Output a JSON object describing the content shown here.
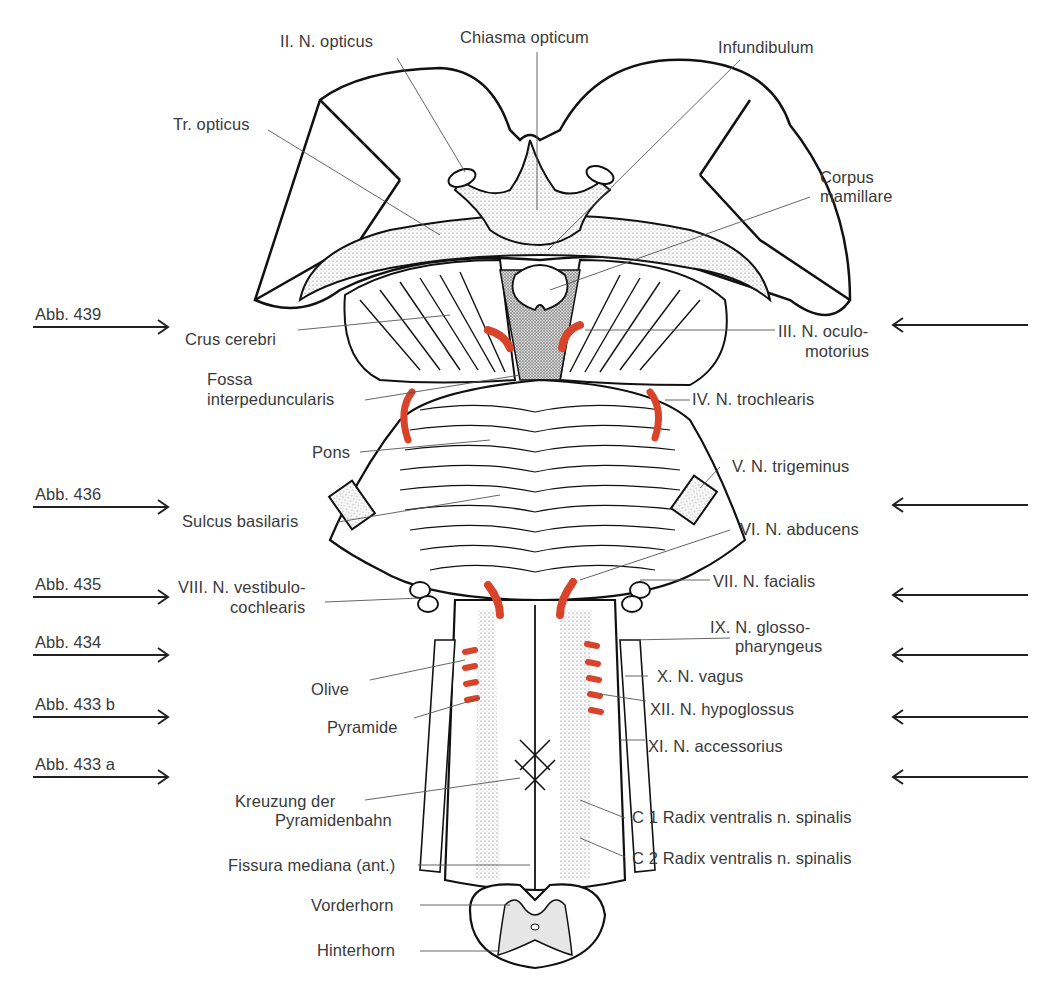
{
  "figure": {
    "type": "anatomical illustration",
    "nerve_color": "#d8432a",
    "outline_color": "#1a1a1a",
    "gray_matter_color": "#e6e6e6"
  },
  "labels_top": {
    "n_opticus": "II. N. opticus",
    "chiasma": "Chiasma opticum",
    "infundibulum": "Infundibulum",
    "tr_opticus": "Tr. opticus",
    "corpus_line1": "Corpus",
    "corpus_line2": "mamillare"
  },
  "labels_left": {
    "crus": "Crus cerebri",
    "fossa_line1": "Fossa",
    "fossa_line2": "interpeduncularis",
    "pons": "Pons",
    "sulcus": "Sulcus basilaris",
    "viii_line1": "VIII. N. vestibulo-",
    "viii_line2": "cochlearis",
    "olive": "Olive",
    "pyramide": "Pyramide",
    "kreuzung_line1": "Kreuzung der",
    "kreuzung_line2": "Pyramidenbahn",
    "fissura": "Fissura mediana (ant.)",
    "vorderhorn": "Vorderhorn",
    "hinterhorn": "Hinterhorn"
  },
  "labels_right": {
    "iii_line1": "III. N. oculo-",
    "iii_line2": "motorius",
    "iv": "IV. N. trochlearis",
    "v": "V. N. trigeminus",
    "vi": "VI. N. abducens",
    "vii": "VII. N. facialis",
    "ix_line1": "IX. N. glosso-",
    "ix_line2": "pharyngeus",
    "x": "X. N. vagus",
    "xii": "XII. N. hypoglossus",
    "xi": "XI. N. accessorius",
    "c1": "C 1 Radix ventralis n. spinalis",
    "c2": "C 2 Radix ventralis n. spinalis"
  },
  "section_refs": [
    {
      "label": "Abb. 439",
      "y": 327
    },
    {
      "label": "Abb. 436",
      "y": 507
    },
    {
      "label": "Abb. 435",
      "y": 597
    },
    {
      "label": "Abb. 434",
      "y": 655
    },
    {
      "label": "Abb. 433 b",
      "y": 717
    },
    {
      "label": "Abb. 433 a",
      "y": 777
    }
  ]
}
